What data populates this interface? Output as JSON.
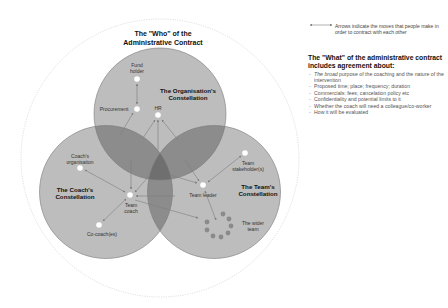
{
  "title": {
    "line1": "The \"Who\" of the",
    "line2": "Administrative Contract"
  },
  "legend": {
    "icon": "double-headed-arrow-icon",
    "text": "Arrows indicate the moves that people make in order to contract with each other"
  },
  "what": {
    "heading_pre": "The \"",
    "heading_bold": "What",
    "heading_post": "\" of the administrative contract includes agreement about:",
    "items": [
      {
        "emph": "The broad",
        "text": " purpose of the coaching and the nature of the intervention"
      },
      {
        "emph": "",
        "text": "Proposed time; place; frequency; duration"
      },
      {
        "emph": "",
        "text": "Commercials: fees; cancelation policy etc"
      },
      {
        "emph": "",
        "text": "Confidentiality and potential limits to it"
      },
      {
        "emph": "",
        "text": "Whether the coach will need a colleague/co-worker"
      },
      {
        "emph": "",
        "text": "How it will be evaluated"
      }
    ]
  },
  "constellations": {
    "organisation": {
      "line1": "The Organisation's",
      "line2": "Constellation"
    },
    "coach": {
      "line1": "The Coach's",
      "line2": "Constellation"
    },
    "team": {
      "line1": "The Team's",
      "line2": "Constellation"
    }
  },
  "nodes": {
    "fund_holder": {
      "line1": "Fund",
      "line2": "holder"
    },
    "procurement": "Procurement",
    "hr": "HR",
    "coachs_org": {
      "line1": "Coach's",
      "line2": "organisation"
    },
    "team_coach": {
      "line1": "Team",
      "line2": "coach"
    },
    "co_coach": "Co-coach(es)",
    "team_stakeholders": {
      "line1": "Team",
      "line2": "stakeholder(s)"
    },
    "team_leader": "Team leader",
    "wider_team": {
      "line1": "The wider",
      "line2": "team"
    }
  },
  "colors": {
    "circle_fill": "#bdbdbd",
    "overlap_fill": "#8c8c8c",
    "center_fill": "#6f6f6f",
    "circle_stroke": "#7a7a7a",
    "outer_ring": "#d6d6d6",
    "node_fill": "#ffffff",
    "arrow": "#7d7d7d",
    "wider_team_dot": "#8a8a8a"
  }
}
